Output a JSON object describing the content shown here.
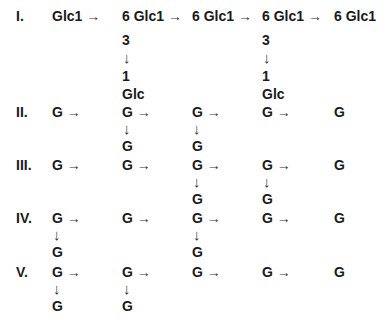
{
  "rows": [
    {
      "label": "I.",
      "y": 8,
      "nodes": [
        {
          "x": 52,
          "text": "Glc1",
          "arrow": "→"
        },
        {
          "x": 122,
          "text": "6 Glc1",
          "arrow": "→",
          "branch": [
            "3",
            "↓",
            "1",
            "Glc"
          ]
        },
        {
          "x": 192,
          "text": "6 Glc1",
          "arrow": "→"
        },
        {
          "x": 262,
          "text": "6 Glc1",
          "arrow": "→",
          "branch": [
            "3",
            "↓",
            "1",
            "Glc"
          ]
        },
        {
          "x": 334,
          "text": "6 Glc1",
          "arrow": ""
        }
      ]
    },
    {
      "label": "II.",
      "y": 104,
      "nodes": [
        {
          "x": 52,
          "text": "G",
          "arrow": "→"
        },
        {
          "x": 122,
          "text": "G",
          "arrow": "→",
          "branch": [
            "↓",
            "G"
          ]
        },
        {
          "x": 192,
          "text": "G",
          "arrow": "→",
          "branch": [
            "↓",
            "G"
          ]
        },
        {
          "x": 262,
          "text": "G",
          "arrow": "→"
        },
        {
          "x": 334,
          "text": "G",
          "arrow": ""
        }
      ]
    },
    {
      "label": "III.",
      "y": 157,
      "nodes": [
        {
          "x": 52,
          "text": "G",
          "arrow": "→"
        },
        {
          "x": 122,
          "text": "G",
          "arrow": "→"
        },
        {
          "x": 192,
          "text": "G",
          "arrow": "→",
          "branch": [
            "↓",
            "G"
          ]
        },
        {
          "x": 262,
          "text": "G",
          "arrow": "→",
          "branch": [
            "↓",
            "G"
          ]
        },
        {
          "x": 334,
          "text": "G",
          "arrow": ""
        }
      ]
    },
    {
      "label": "IV.",
      "y": 210,
      "nodes": [
        {
          "x": 52,
          "text": "G",
          "arrow": "→",
          "branch": [
            "↓",
            "G"
          ]
        },
        {
          "x": 122,
          "text": "G",
          "arrow": "→"
        },
        {
          "x": 192,
          "text": "G",
          "arrow": "→",
          "branch": [
            "↓",
            "G"
          ]
        },
        {
          "x": 262,
          "text": "G",
          "arrow": "→"
        },
        {
          "x": 334,
          "text": "G",
          "arrow": ""
        }
      ]
    },
    {
      "label": "V.",
      "y": 264,
      "nodes": [
        {
          "x": 52,
          "text": "G",
          "arrow": "→",
          "branch": [
            "↓",
            "G"
          ]
        },
        {
          "x": 122,
          "text": "G",
          "arrow": "→",
          "branch": [
            "↓",
            "G"
          ]
        },
        {
          "x": 192,
          "text": "G",
          "arrow": "→"
        },
        {
          "x": 262,
          "text": "G",
          "arrow": "→"
        },
        {
          "x": 334,
          "text": "G",
          "arrow": ""
        }
      ]
    }
  ]
}
